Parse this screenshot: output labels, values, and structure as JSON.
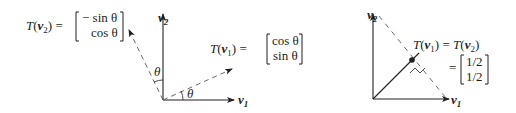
{
  "figure": {
    "left_panel": {
      "axes": {
        "x_label": "v",
        "x_sub": "1",
        "y_label": "v",
        "y_sub": "2"
      },
      "tv2": {
        "lhs_T": "T",
        "lhs_v": "v",
        "lhs_sub": "2",
        "equals": "=",
        "row1": "− sin θ",
        "row2": "cos θ"
      },
      "tv1": {
        "lhs_T": "T",
        "lhs_v": "v",
        "lhs_sub": "1",
        "equals": "=",
        "row1": "cos θ",
        "row2": "sin θ"
      },
      "angle_label_upper": "θ",
      "angle_label_lower": "θ"
    },
    "right_panel": {
      "axes": {
        "x_label": "v",
        "x_sub": "1",
        "y_label": "v",
        "y_sub": "2"
      },
      "eq_line1": {
        "T": "T",
        "v1": "v",
        "sub1": "1",
        "equals": "=",
        "v2": "v",
        "sub2": "2"
      },
      "eq_line2": {
        "equals": "=",
        "row1": "1/2",
        "row2": "1/2"
      }
    },
    "colors": {
      "ink": "#231f20",
      "dashed": "#555555",
      "background": "#ffffff"
    }
  }
}
